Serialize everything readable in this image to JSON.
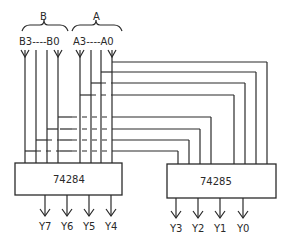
{
  "groups": {
    "b_label": "B",
    "a_label": "A",
    "b_range": "B3----B0",
    "a_range": "A3----A0"
  },
  "chips": {
    "left": "74284",
    "right": "74285"
  },
  "outputs": {
    "left": [
      "Y7",
      "Y6",
      "Y5",
      "Y4"
    ],
    "right": [
      "Y3",
      "Y2",
      "Y1",
      "Y0"
    ]
  }
}
